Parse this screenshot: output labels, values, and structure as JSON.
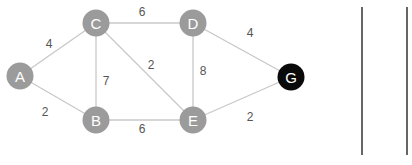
{
  "graph": {
    "nodes": [
      {
        "id": "A",
        "label": "A",
        "x": 20,
        "y": 76,
        "type": "normal"
      },
      {
        "id": "C",
        "label": "C",
        "x": 96,
        "y": 23,
        "type": "normal"
      },
      {
        "id": "D",
        "label": "D",
        "x": 193,
        "y": 23,
        "type": "normal"
      },
      {
        "id": "B",
        "label": "B",
        "x": 96,
        "y": 120,
        "type": "normal"
      },
      {
        "id": "E",
        "label": "E",
        "x": 193,
        "y": 120,
        "type": "normal"
      },
      {
        "id": "G",
        "label": "G",
        "x": 291,
        "y": 77,
        "type": "target"
      }
    ],
    "edges": [
      {
        "from": "A",
        "to": "C",
        "weight": "4",
        "label_x": 49,
        "label_y": 44
      },
      {
        "from": "A",
        "to": "B",
        "weight": "2",
        "label_x": 45,
        "label_y": 112
      },
      {
        "from": "C",
        "to": "D",
        "weight": "6",
        "label_x": 142,
        "label_y": 12
      },
      {
        "from": "C",
        "to": "B",
        "weight": "7",
        "label_x": 106,
        "label_y": 81
      },
      {
        "from": "C",
        "to": "E",
        "weight": "2",
        "label_x": 151,
        "label_y": 65
      },
      {
        "from": "D",
        "to": "E",
        "weight": "8",
        "label_x": 203,
        "label_y": 71
      },
      {
        "from": "B",
        "to": "E",
        "weight": "6",
        "label_x": 142,
        "label_y": 129
      },
      {
        "from": "D",
        "to": "G",
        "weight": "4",
        "label_x": 250,
        "label_y": 33
      },
      {
        "from": "E",
        "to": "G",
        "weight": "2",
        "label_x": 250,
        "label_y": 117
      }
    ]
  },
  "colors": {
    "node": "#9b9b9b",
    "target_node": "#0a0a0a",
    "edge": "#c8c8c8",
    "weight_text": "#555555",
    "divider": "#666666"
  },
  "dividers": [
    {
      "x": 362,
      "y1": 7,
      "y2": 155
    },
    {
      "x": 407,
      "y1": 7,
      "y2": 155
    }
  ]
}
